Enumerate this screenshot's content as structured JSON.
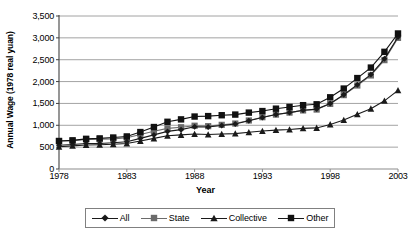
{
  "chart_data": {
    "type": "line",
    "title": "",
    "xlabel": "Year",
    "ylabel": "Annual Wage (1978 real yuan)",
    "x": [
      1978,
      1979,
      1980,
      1981,
      1982,
      1983,
      1984,
      1985,
      1986,
      1987,
      1988,
      1989,
      1990,
      1991,
      1992,
      1993,
      1994,
      1995,
      1996,
      1997,
      1998,
      1999,
      2000,
      2001,
      2002,
      2003
    ],
    "xlim": [
      1978,
      2003
    ],
    "ylim": [
      0,
      3500
    ],
    "yticks": [
      0,
      500,
      1000,
      1500,
      2000,
      2500,
      3000,
      3500
    ],
    "ytick_labels": [
      "0",
      "500",
      "1,000",
      "1,500",
      "2,000",
      "2,500",
      "3,000",
      "3,500"
    ],
    "xticks": [
      1978,
      1983,
      1988,
      1993,
      1998,
      2003
    ],
    "xtick_labels": [
      "1978",
      "1983",
      "1988",
      "1993",
      "1998",
      "2003"
    ],
    "grid": "horizontal",
    "legend_position": "bottom",
    "series": [
      {
        "name": "All",
        "marker": "diamond",
        "color": "#1a1a1a",
        "values": [
          545,
          560,
          585,
          585,
          600,
          625,
          700,
          780,
          860,
          900,
          965,
          960,
          995,
          1030,
          1105,
          1180,
          1245,
          1290,
          1345,
          1370,
          1500,
          1700,
          1930,
          2160,
          2520,
          3020
        ]
      },
      {
        "name": "State",
        "marker": "square",
        "color": "#6b6b6b",
        "values": [
          640,
          650,
          675,
          680,
          690,
          715,
          790,
          865,
          930,
          955,
          990,
          980,
          1010,
          1040,
          1110,
          1185,
          1245,
          1290,
          1340,
          1360,
          1490,
          1690,
          1910,
          2140,
          2490,
          3000
        ]
      },
      {
        "name": "Collective",
        "marker": "triangle",
        "color": "#1a1a1a",
        "values": [
          510,
          530,
          550,
          555,
          565,
          585,
          640,
          700,
          760,
          780,
          800,
          790,
          800,
          810,
          840,
          870,
          890,
          905,
          930,
          940,
          1020,
          1120,
          1250,
          1380,
          1560,
          1800
        ]
      },
      {
        "name": "Other",
        "marker": "square",
        "color": "#111111",
        "values": [
          640,
          655,
          690,
          700,
          720,
          745,
          845,
          960,
          1080,
          1135,
          1200,
          1210,
          1230,
          1245,
          1290,
          1325,
          1380,
          1420,
          1460,
          1480,
          1640,
          1840,
          2080,
          2320,
          2680,
          3100
        ]
      }
    ]
  },
  "legend": {
    "items": [
      {
        "label": "All"
      },
      {
        "label": "State"
      },
      {
        "label": "Collective"
      },
      {
        "label": "Other"
      }
    ]
  }
}
